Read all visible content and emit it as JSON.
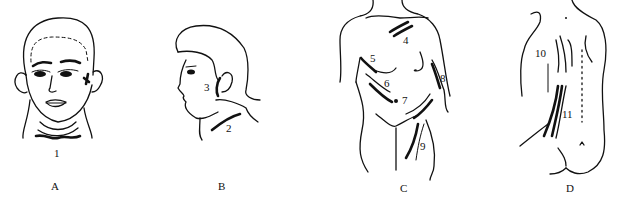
{
  "figure": {
    "panels": [
      {
        "id": "A",
        "label": "A",
        "view": "head-front",
        "incisions": [
          {
            "number": "1"
          }
        ]
      },
      {
        "id": "B",
        "label": "B",
        "view": "head-profile",
        "incisions": [
          {
            "number": "2"
          },
          {
            "number": "3"
          }
        ]
      },
      {
        "id": "C",
        "label": "C",
        "view": "torso-front",
        "incisions": [
          {
            "number": "4"
          },
          {
            "number": "5"
          },
          {
            "number": "6"
          },
          {
            "number": "7"
          },
          {
            "number": "8"
          },
          {
            "number": "9"
          }
        ]
      },
      {
        "id": "D",
        "label": "D",
        "view": "torso-back",
        "incisions": [
          {
            "number": "10"
          },
          {
            "number": "11"
          }
        ]
      }
    ],
    "colors": {
      "line": "#111111",
      "background": "#ffffff"
    }
  }
}
